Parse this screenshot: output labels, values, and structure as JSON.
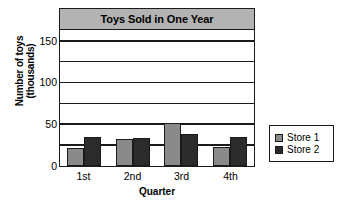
{
  "chart_data": {
    "type": "bar",
    "title": "Toys Sold in One Year",
    "xlabel": "Quarter",
    "ylabel": "Number of toys\n(thousands)",
    "ylabel_line1": "Number of toys",
    "ylabel_line2": "(thousands)",
    "categories": [
      "1st",
      "2nd",
      "3rd",
      "4th"
    ],
    "series": [
      {
        "name": "Store 1",
        "color": "#8a8a8a",
        "values": [
          22,
          32,
          52,
          23
        ]
      },
      {
        "name": "Store 2",
        "color": "#2b2b2b",
        "values": [
          35,
          34,
          38,
          35
        ]
      }
    ],
    "ylim": [
      0,
      162
    ],
    "yticks": [
      0,
      50,
      100,
      150
    ],
    "ytick_labels": [
      "0",
      "50",
      "100",
      "150"
    ],
    "gridlines": [
      25,
      50,
      75,
      100,
      125,
      150
    ],
    "grid": true,
    "legend_position": "right-outside",
    "title_band_color": "#b3b3b3",
    "axis_color": "#1a1a1a",
    "plot_background": "#ffffff"
  }
}
